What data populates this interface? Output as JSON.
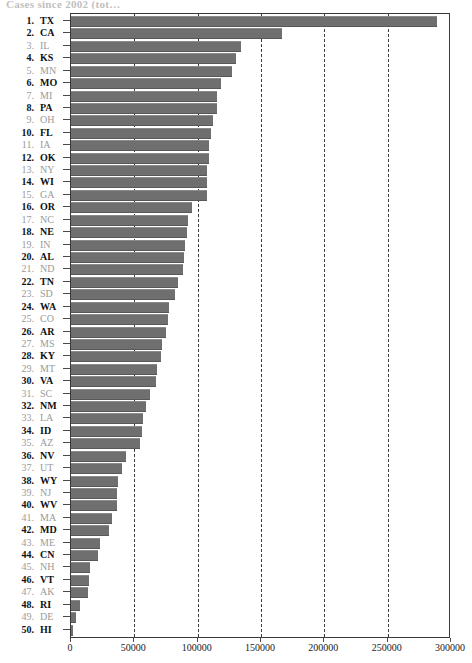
{
  "title_strip": "Cases since 2002 (tot…",
  "chart_data": {
    "type": "bar",
    "orientation": "horizontal",
    "title": "",
    "xlabel": "",
    "ylabel": "",
    "xlim": [
      0,
      300000
    ],
    "xticks": [
      0,
      50000,
      100000,
      150000,
      200000,
      250000,
      300000
    ],
    "xtick_labels": [
      "0",
      "50000",
      "100000",
      "150000",
      "200000",
      "250000",
      "300000"
    ],
    "grid": "vertical-dashed",
    "legend": "none",
    "bar_color": "#6f6f6f",
    "categories": [
      "TX",
      "CA",
      "IL",
      "KS",
      "MN",
      "MO",
      "MI",
      "PA",
      "OH",
      "FL",
      "IA",
      "OK",
      "NY",
      "WI",
      "GA",
      "OR",
      "NC",
      "NE",
      "IN",
      "AL",
      "ND",
      "TN",
      "SD",
      "WA",
      "CO",
      "AR",
      "MS",
      "KY",
      "MT",
      "VA",
      "SC",
      "NM",
      "LA",
      "ID",
      "AZ",
      "NV",
      "UT",
      "WY",
      "NJ",
      "WV",
      "MA",
      "MD",
      "ME",
      "CN",
      "NH",
      "VT",
      "AK",
      "RI",
      "DE",
      "HI"
    ],
    "ranks": [
      1,
      2,
      3,
      4,
      5,
      6,
      7,
      8,
      9,
      10,
      11,
      12,
      13,
      14,
      15,
      16,
      17,
      18,
      19,
      20,
      21,
      22,
      23,
      24,
      25,
      26,
      27,
      28,
      29,
      30,
      31,
      32,
      33,
      34,
      35,
      36,
      37,
      38,
      39,
      40,
      41,
      42,
      43,
      44,
      45,
      46,
      47,
      48,
      49,
      50
    ],
    "values": [
      290000,
      167000,
      135000,
      131000,
      128000,
      119000,
      116000,
      116000,
      113000,
      111000,
      110000,
      110000,
      108000,
      108000,
      108000,
      96000,
      93000,
      92000,
      91000,
      90000,
      89000,
      85000,
      83000,
      78000,
      77000,
      76000,
      73000,
      72000,
      69000,
      68000,
      63000,
      60000,
      58000,
      57000,
      55000,
      44000,
      41000,
      38000,
      37000,
      37000,
      33000,
      31000,
      24000,
      22000,
      16000,
      15000,
      14000,
      7500,
      5000,
      2000
    ],
    "labels": [
      {
        "rank": 1,
        "abbr": "TX",
        "value": 290000,
        "emphasis": "normal"
      },
      {
        "rank": 2,
        "abbr": "CA",
        "value": 167000,
        "emphasis": "bold"
      },
      {
        "rank": 3,
        "abbr": "IL",
        "value": 135000,
        "emphasis": "faint"
      },
      {
        "rank": 4,
        "abbr": "KS",
        "value": 131000,
        "emphasis": "bold"
      },
      {
        "rank": 5,
        "abbr": "MN",
        "value": 128000,
        "emphasis": "faint"
      },
      {
        "rank": 6,
        "abbr": "MO",
        "value": 119000,
        "emphasis": "bold"
      },
      {
        "rank": 7,
        "abbr": "MI",
        "value": 116000,
        "emphasis": "faint"
      },
      {
        "rank": 8,
        "abbr": "PA",
        "value": 116000,
        "emphasis": "bold"
      },
      {
        "rank": 9,
        "abbr": "OH",
        "value": 113000,
        "emphasis": "faint"
      },
      {
        "rank": 10,
        "abbr": "FL",
        "value": 111000,
        "emphasis": "bold"
      },
      {
        "rank": 11,
        "abbr": "IA",
        "value": 110000,
        "emphasis": "faint"
      },
      {
        "rank": 12,
        "abbr": "OK",
        "value": 110000,
        "emphasis": "bold"
      },
      {
        "rank": 13,
        "abbr": "NY",
        "value": 108000,
        "emphasis": "faint"
      },
      {
        "rank": 14,
        "abbr": "WI",
        "value": 108000,
        "emphasis": "bold"
      },
      {
        "rank": 15,
        "abbr": "GA",
        "value": 108000,
        "emphasis": "faint"
      },
      {
        "rank": 16,
        "abbr": "OR",
        "value": 96000,
        "emphasis": "bold"
      },
      {
        "rank": 17,
        "abbr": "NC",
        "value": 93000,
        "emphasis": "faint"
      },
      {
        "rank": 18,
        "abbr": "NE",
        "value": 92000,
        "emphasis": "bold"
      },
      {
        "rank": 19,
        "abbr": "IN",
        "value": 91000,
        "emphasis": "faint"
      },
      {
        "rank": 20,
        "abbr": "AL",
        "value": 90000,
        "emphasis": "bold"
      },
      {
        "rank": 21,
        "abbr": "ND",
        "value": 89000,
        "emphasis": "faint"
      },
      {
        "rank": 22,
        "abbr": "TN",
        "value": 85000,
        "emphasis": "bold"
      },
      {
        "rank": 23,
        "abbr": "SD",
        "value": 83000,
        "emphasis": "faint"
      },
      {
        "rank": 24,
        "abbr": "WA",
        "value": 78000,
        "emphasis": "bold"
      },
      {
        "rank": 25,
        "abbr": "CO",
        "value": 77000,
        "emphasis": "faint"
      },
      {
        "rank": 26,
        "abbr": "AR",
        "value": 76000,
        "emphasis": "bold"
      },
      {
        "rank": 27,
        "abbr": "MS",
        "value": 73000,
        "emphasis": "faint"
      },
      {
        "rank": 28,
        "abbr": "KY",
        "value": 72000,
        "emphasis": "bold"
      },
      {
        "rank": 29,
        "abbr": "MT",
        "value": 69000,
        "emphasis": "faint"
      },
      {
        "rank": 30,
        "abbr": "VA",
        "value": 68000,
        "emphasis": "bold"
      },
      {
        "rank": 31,
        "abbr": "SC",
        "value": 63000,
        "emphasis": "faint"
      },
      {
        "rank": 32,
        "abbr": "NM",
        "value": 60000,
        "emphasis": "bold"
      },
      {
        "rank": 33,
        "abbr": "LA",
        "value": 58000,
        "emphasis": "faint"
      },
      {
        "rank": 34,
        "abbr": "ID",
        "value": 57000,
        "emphasis": "bold"
      },
      {
        "rank": 35,
        "abbr": "AZ",
        "value": 55000,
        "emphasis": "faint"
      },
      {
        "rank": 36,
        "abbr": "NV",
        "value": 44000,
        "emphasis": "bold"
      },
      {
        "rank": 37,
        "abbr": "UT",
        "value": 41000,
        "emphasis": "faint"
      },
      {
        "rank": 38,
        "abbr": "WY",
        "value": 38000,
        "emphasis": "bold"
      },
      {
        "rank": 39,
        "abbr": "NJ",
        "value": 37000,
        "emphasis": "faint"
      },
      {
        "rank": 40,
        "abbr": "WV",
        "value": 37000,
        "emphasis": "bold"
      },
      {
        "rank": 41,
        "abbr": "MA",
        "value": 33000,
        "emphasis": "faint"
      },
      {
        "rank": 42,
        "abbr": "MD",
        "value": 31000,
        "emphasis": "bold"
      },
      {
        "rank": 43,
        "abbr": "ME",
        "value": 24000,
        "emphasis": "faint"
      },
      {
        "rank": 44,
        "abbr": "CN",
        "value": 22000,
        "emphasis": "bold"
      },
      {
        "rank": 45,
        "abbr": "NH",
        "value": 16000,
        "emphasis": "faint"
      },
      {
        "rank": 46,
        "abbr": "VT",
        "value": 15000,
        "emphasis": "bold"
      },
      {
        "rank": 47,
        "abbr": "AK",
        "value": 14000,
        "emphasis": "faint"
      },
      {
        "rank": 48,
        "abbr": "RI",
        "value": 7500,
        "emphasis": "bold"
      },
      {
        "rank": 49,
        "abbr": "DE",
        "value": 5000,
        "emphasis": "faint"
      },
      {
        "rank": 50,
        "abbr": "HI",
        "value": 2000,
        "emphasis": "bold"
      }
    ]
  }
}
